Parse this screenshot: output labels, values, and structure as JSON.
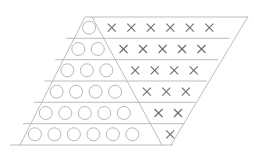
{
  "diagram": {
    "colors": {
      "background": "#ffffff",
      "lines": "#b4b4b4",
      "circles": "#b0b0b0",
      "crosses": "#6a6a6a"
    },
    "rows": [
      {
        "circles": 1,
        "crosses": 6
      },
      {
        "circles": 2,
        "crosses": 5
      },
      {
        "circles": 3,
        "crosses": 4
      },
      {
        "circles": 4,
        "crosses": 3
      },
      {
        "circles": 5,
        "crosses": 2
      },
      {
        "circles": 6,
        "crosses": 1
      }
    ],
    "total_circles": 21,
    "total_crosses": 21
  }
}
